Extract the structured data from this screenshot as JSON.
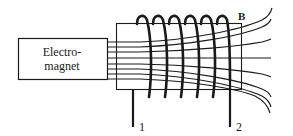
{
  "diagram": {
    "electromagnet_label_line1": "Electro-",
    "electromagnet_label_line2": "magnet",
    "field_label": "B",
    "terminal_1_label": "1",
    "terminal_2_label": "2",
    "coil_turns": 6,
    "field_line_count": 8,
    "colors": {
      "ink": "#1a1a1a",
      "background": "#ffffff"
    }
  }
}
